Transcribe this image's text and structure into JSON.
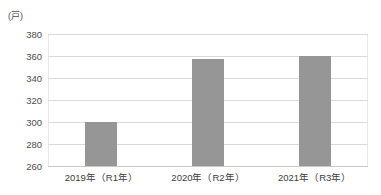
{
  "chart_data": {
    "type": "bar",
    "title": "",
    "subtitle": "",
    "xlabel": "",
    "ylabel": "",
    "unit_label": "(戸)",
    "categories": [
      "2019年（R1年）",
      "2020年（R2年）",
      "2021年（R3年）"
    ],
    "values": [
      300,
      357,
      360
    ],
    "series": [
      {
        "name": "戸数",
        "values": [
          300,
          357,
          360
        ],
        "color": "#969696"
      }
    ],
    "ylim": [
      260,
      380
    ],
    "ytick_values": [
      380,
      360,
      340,
      320,
      300,
      280,
      260
    ],
    "ytick_labels": [
      "380",
      "360",
      "340",
      "320",
      "300",
      "280",
      "260"
    ],
    "grid": true,
    "grid_axis": "y",
    "grid_color": "#d9d9d9",
    "legend": false,
    "legend_position": "none",
    "background_color": "#ffffff",
    "bar_color": "#969696",
    "axis_text_color": "#4d4d4d"
  }
}
